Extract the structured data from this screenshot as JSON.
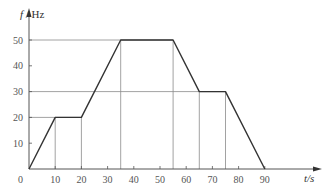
{
  "chart_data": {
    "type": "line",
    "title": "",
    "xlabel": "t/s",
    "ylabel": "f / Hz",
    "x_ticks": [
      0,
      10,
      20,
      30,
      40,
      50,
      60,
      70,
      80,
      90
    ],
    "y_ticks": [
      10,
      20,
      30,
      40,
      50
    ],
    "xlim": [
      0,
      100
    ],
    "ylim": [
      0,
      55
    ],
    "grid": false,
    "series": [
      {
        "name": "frequency",
        "x": [
          0,
          10,
          20,
          35,
          55,
          65,
          75,
          90
        ],
        "y": [
          0,
          20,
          20,
          50,
          50,
          30,
          30,
          0
        ]
      }
    ],
    "guide_lines": {
      "horizontal": [
        20,
        30,
        50
      ],
      "vertical": [
        10,
        20,
        35,
        55,
        65,
        75
      ]
    }
  },
  "labels": {
    "origin": "0",
    "x_axis": "t/s",
    "y_axis_var": "f",
    "y_axis_unit": " / Hz"
  }
}
